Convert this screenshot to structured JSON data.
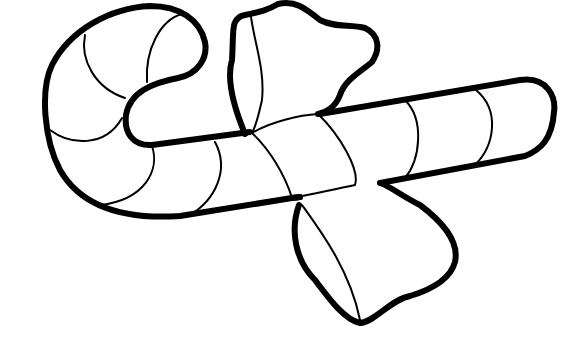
{
  "image": {
    "subject": "candy cane with bow coloring page",
    "background": "#ffffff",
    "line_color": "#000000"
  }
}
